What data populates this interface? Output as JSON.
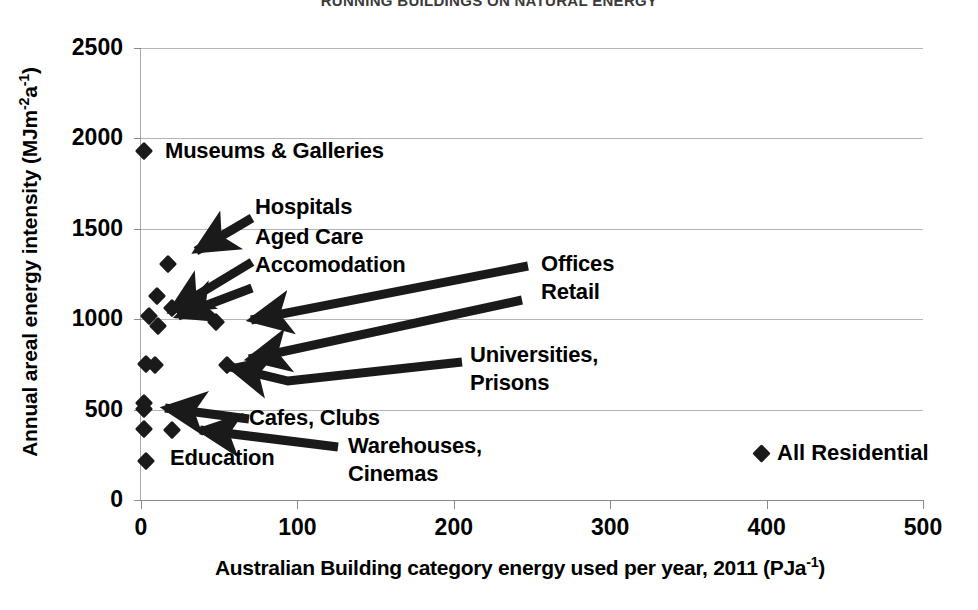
{
  "chart_data": {
    "type": "scatter",
    "title": "RUNNING BUILDINGS ON NATURAL ENERGY",
    "xlabel": "Australian Building category energy used per year, 2011  (PJa-1)",
    "xlabel_main": "Australian Building category energy used per year, 2011  (PJa",
    "ylabel_main": "Annual areal energy intensity  (MJm",
    "ylabel": "Annual areal energy intensity (MJm-2a-1)",
    "xlim": [
      0,
      500
    ],
    "ylim": [
      0,
      2500
    ],
    "xticks": [
      "0",
      "100",
      "200",
      "300",
      "400",
      "500"
    ],
    "yticks": [
      "0",
      "500",
      "1000",
      "1500",
      "2000",
      "2500"
    ],
    "grid": true,
    "legend_position": "inside-right",
    "series": [
      {
        "name": "All Residential",
        "marker": "diamond",
        "color": "#1a1a1a",
        "points": [
          {
            "label": "Museums & Galleries",
            "x": 2,
            "y": 1930
          },
          {
            "label": "Hospitals",
            "x": 17,
            "y": 1305
          },
          {
            "label": "Aged Care",
            "x": 10,
            "y": 1130
          },
          {
            "label": "Accomodation",
            "x": 20,
            "y": 1060
          },
          {
            "label": "Retail",
            "x": 5,
            "y": 1015
          },
          {
            "label": "",
            "x": 11,
            "y": 960
          },
          {
            "label": "Offices",
            "x": 48,
            "y": 985
          },
          {
            "label": "Prisons",
            "x": 3,
            "y": 750
          },
          {
            "label": "",
            "x": 9,
            "y": 748
          },
          {
            "label": "Universities",
            "x": 55,
            "y": 745
          },
          {
            "label": "Cafes",
            "x": 2,
            "y": 535
          },
          {
            "label": "Clubs",
            "x": 2,
            "y": 505
          },
          {
            "label": "Warehouses",
            "x": 2,
            "y": 390
          },
          {
            "label": "Cinemas",
            "x": 20,
            "y": 385
          },
          {
            "label": "Education",
            "x": 3,
            "y": 215
          }
        ]
      }
    ],
    "annotations": [
      "Museums & Galleries",
      "Hospitals",
      "Aged Care",
      "Accomodation",
      "Offices",
      "Retail",
      "Universities,",
      "Prisons",
      "Cafes, Clubs",
      "Warehouses,",
      "Cinemas",
      "Education"
    ]
  },
  "labels": {
    "museums": "Museums & Galleries",
    "hospitals": "Hospitals",
    "aged_care": "Aged Care",
    "accomodation": "Accomodation",
    "offices": "Offices",
    "retail": "Retail",
    "universities": "Universities,",
    "prisons": "Prisons",
    "cafes_clubs": "Cafes, Clubs",
    "warehouses": "Warehouses,",
    "cinemas": "Cinemas",
    "education": "Education"
  },
  "legend": {
    "label": "All Residential"
  },
  "axis": {
    "y_title_prefix": "Annual areal energy intensity  (MJm",
    "y_title_sup1": "-2",
    "y_title_mid": "a",
    "y_title_sup2": "-1",
    "y_title_suffix": ")",
    "x_title_prefix": "Australian Building category energy used per year, 2011  (PJa",
    "x_title_sup": "-1",
    "x_title_suffix": ")",
    "yticks": [
      "2500",
      "2000",
      "1500",
      "1000",
      "500",
      "0"
    ],
    "xticks": [
      "0",
      "100",
      "200",
      "300",
      "400",
      "500"
    ]
  },
  "colors": {
    "marker": "#1a1a1a",
    "grid": "#b5b5b5",
    "axis": "#8a8a8a",
    "title": "#3a3a3a"
  }
}
